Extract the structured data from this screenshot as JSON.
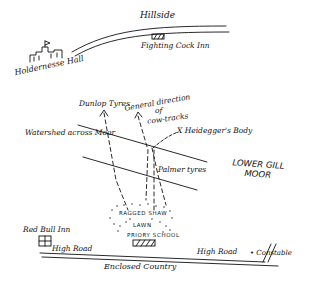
{
  "map": {
    "labels": {
      "hillside": "Hillside",
      "holdernesse_hall": "Holdernesse Hall",
      "fighting_cock_inn": "Fighting Cock Inn",
      "dunlop_tyres": "Dunlop Tyres",
      "general_direction": "General direction",
      "of": "of",
      "cow_tracks": "cow-tracks",
      "heidegger_body": "X Heidegger's Body",
      "watershed": "Watershed across Moor",
      "lower_gill": "LOWER GILL",
      "moor": "MOOR",
      "palmer_tyres": "Palmer tyres",
      "ragged_shaw": "RAGGED SHAW",
      "lawn": "LAWN",
      "priory_school": "PRIORY SCHOOL",
      "red_bull_inn": "Red Bull Inn",
      "high_road_left": "High Road",
      "high_road_right": "High Road",
      "constable": "• Constable",
      "enclosed_country": "Enclosed Country"
    },
    "colors": {
      "ink": "#111111",
      "paper": "#ffffff"
    }
  }
}
